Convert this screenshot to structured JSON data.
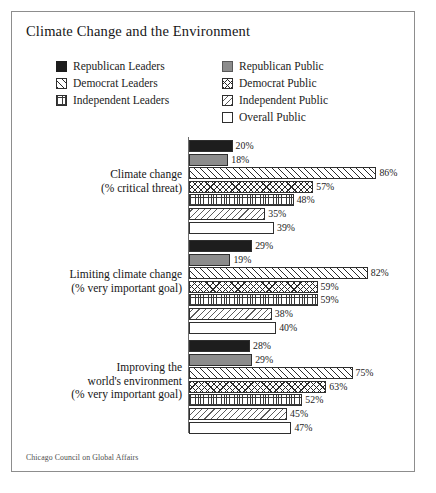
{
  "chart_data": {
    "type": "bar",
    "orientation": "horizontal",
    "title": "Climate Change and the Environment",
    "xlabel": "",
    "ylabel": "",
    "xlim": [
      0,
      100
    ],
    "grid": false,
    "legend_position": "top",
    "value_suffix": "%",
    "source": "Chicago Council on Global Affairs",
    "categories": [
      "Climate change\n(% critical threat)",
      "Limiting climate change\n(% very important goal)",
      "Improving the\nworld's environment\n(% very important goal)"
    ],
    "series": [
      {
        "name": "Republican Leaders",
        "pattern": "solid-black",
        "values": [
          20,
          29,
          28
        ]
      },
      {
        "name": "Republican Public",
        "pattern": "solid-gray",
        "values": [
          18,
          19,
          29
        ]
      },
      {
        "name": "Democrat Leaders",
        "pattern": "diag-fwd",
        "values": [
          86,
          82,
          75
        ]
      },
      {
        "name": "Democrat Public",
        "pattern": "cross",
        "values": [
          57,
          59,
          63
        ]
      },
      {
        "name": "Independent Leaders",
        "pattern": "dotted",
        "values": [
          48,
          59,
          52
        ]
      },
      {
        "name": "Independent Public",
        "pattern": "diag-back",
        "values": [
          35,
          38,
          45
        ]
      },
      {
        "name": "Overall Public",
        "pattern": "empty",
        "values": [
          39,
          40,
          47
        ]
      }
    ]
  },
  "title": "Climate Change and the Environment",
  "legend": {
    "leaders": [
      {
        "label": "Republican Leaders",
        "swatch": "solid-black"
      },
      {
        "label": "Democrat Leaders",
        "swatch": "diag-fwd"
      },
      {
        "label": "Independent Leaders",
        "swatch": "dotted"
      }
    ],
    "public": [
      {
        "label": "Republican Public",
        "swatch": "solid-gray"
      },
      {
        "label": "Democrat Public",
        "swatch": "cross"
      },
      {
        "label": "Independent Public",
        "swatch": "diag-back"
      },
      {
        "label": "Overall Public",
        "swatch": "empty"
      }
    ]
  },
  "groups": [
    {
      "label_line1": "Climate change",
      "label_line2": "(% critical threat)",
      "label_line3": "",
      "bars": [
        {
          "value_label": "20%",
          "value": 20,
          "pattern": "solid-black"
        },
        {
          "value_label": "18%",
          "value": 18,
          "pattern": "solid-gray"
        },
        {
          "value_label": "86%",
          "value": 86,
          "pattern": "diag-fwd"
        },
        {
          "value_label": "57%",
          "value": 57,
          "pattern": "cross"
        },
        {
          "value_label": "48%",
          "value": 48,
          "pattern": "dotted"
        },
        {
          "value_label": "35%",
          "value": 35,
          "pattern": "diag-back"
        },
        {
          "value_label": "39%",
          "value": 39,
          "pattern": "empty"
        }
      ]
    },
    {
      "label_line1": "Limiting climate change",
      "label_line2": "(% very important goal)",
      "label_line3": "",
      "bars": [
        {
          "value_label": "29%",
          "value": 29,
          "pattern": "solid-black"
        },
        {
          "value_label": "19%",
          "value": 19,
          "pattern": "solid-gray"
        },
        {
          "value_label": "82%",
          "value": 82,
          "pattern": "diag-fwd"
        },
        {
          "value_label": "59%",
          "value": 59,
          "pattern": "cross"
        },
        {
          "value_label": "59%",
          "value": 59,
          "pattern": "dotted"
        },
        {
          "value_label": "38%",
          "value": 38,
          "pattern": "diag-back"
        },
        {
          "value_label": "40%",
          "value": 40,
          "pattern": "empty"
        }
      ]
    },
    {
      "label_line1": "Improving the",
      "label_line2": "world's environment",
      "label_line3": "(% very important goal)",
      "bars": [
        {
          "value_label": "28%",
          "value": 28,
          "pattern": "solid-black"
        },
        {
          "value_label": "29%",
          "value": 29,
          "pattern": "solid-gray"
        },
        {
          "value_label": "75%",
          "value": 75,
          "pattern": "diag-fwd"
        },
        {
          "value_label": "63%",
          "value": 63,
          "pattern": "cross"
        },
        {
          "value_label": "52%",
          "value": 52,
          "pattern": "dotted"
        },
        {
          "value_label": "45%",
          "value": 45,
          "pattern": "diag-back"
        },
        {
          "value_label": "47%",
          "value": 47,
          "pattern": "empty"
        }
      ]
    }
  ],
  "source_note": "Chicago Council on Global Affairs"
}
